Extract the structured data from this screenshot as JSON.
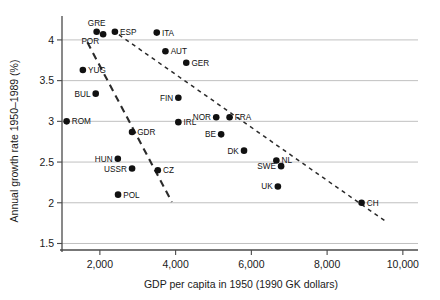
{
  "chart_data": {
    "type": "scatter",
    "title": "",
    "xlabel": "GDP per capita in 1950 (1990 GK dollars)",
    "ylabel": "Annual growth rate 1950–1989 (%)",
    "xlim": [
      1000,
      10400
    ],
    "ylim": [
      1.42,
      4.22
    ],
    "xticks": [
      2000,
      4000,
      6000,
      8000,
      10000
    ],
    "xtick_labels": [
      "2,000",
      "4,000",
      "6,000",
      "8,000",
      "10,000"
    ],
    "yticks": [
      1.5,
      2,
      2.5,
      3,
      3.5,
      4
    ],
    "ytick_labels": [
      "1.5",
      "2",
      "2.5",
      "3",
      "3.5",
      "4"
    ],
    "grid": "horizontal",
    "legend": "none",
    "marker": "filled-circle",
    "points": [
      {
        "label": "GRE",
        "x": 1915,
        "y": 4.1,
        "label_pos": "above"
      },
      {
        "label": "POR",
        "x": 2086,
        "y": 4.07,
        "label_pos": "below-left"
      },
      {
        "label": "ESP",
        "x": 2397,
        "y": 4.1,
        "label_pos": "right"
      },
      {
        "label": "ITA",
        "x": 3502,
        "y": 4.09,
        "label_pos": "right"
      },
      {
        "label": "AUT",
        "x": 3731,
        "y": 3.86,
        "label_pos": "right"
      },
      {
        "label": "GER",
        "x": 4281,
        "y": 3.72,
        "label_pos": "right"
      },
      {
        "label": "YUG",
        "x": 1551,
        "y": 3.63,
        "label_pos": "right"
      },
      {
        "label": "BUL",
        "x": 1890,
        "y": 3.34,
        "label_pos": "left"
      },
      {
        "label": "FIN",
        "x": 4072,
        "y": 3.29,
        "label_pos": "left"
      },
      {
        "label": "ROM",
        "x": 1122,
        "y": 3.0,
        "label_pos": "right"
      },
      {
        "label": "NOR",
        "x": 5072,
        "y": 3.05,
        "label_pos": "left"
      },
      {
        "label": "FRA",
        "x": 5425,
        "y": 3.05,
        "label_pos": "right"
      },
      {
        "label": "IRL",
        "x": 4072,
        "y": 2.99,
        "label_pos": "right"
      },
      {
        "label": "BE",
        "x": 5202,
        "y": 2.84,
        "label_pos": "left"
      },
      {
        "label": "GDR",
        "x": 2850,
        "y": 2.87,
        "label_pos": "right"
      },
      {
        "label": "DK",
        "x": 5806,
        "y": 2.64,
        "label_pos": "left"
      },
      {
        "label": "NL",
        "x": 6660,
        "y": 2.52,
        "label_pos": "right"
      },
      {
        "label": "SWE",
        "x": 6785,
        "y": 2.45,
        "label_pos": "left"
      },
      {
        "label": "HUN",
        "x": 2474,
        "y": 2.54,
        "label_pos": "left"
      },
      {
        "label": "USSR",
        "x": 2850,
        "y": 2.42,
        "label_pos": "left"
      },
      {
        "label": "CZ",
        "x": 3530,
        "y": 2.4,
        "label_pos": "right"
      },
      {
        "label": "UK",
        "x": 6700,
        "y": 2.2,
        "label_pos": "left"
      },
      {
        "label": "POL",
        "x": 2480,
        "y": 2.1,
        "label_pos": "right"
      },
      {
        "label": "CH",
        "x": 8910,
        "y": 2.0,
        "label_pos": "right"
      }
    ],
    "trend_lines": [
      {
        "name": "socialist-countries-trend",
        "x1": 1670,
        "y1": 3.97,
        "x2": 3900,
        "y2": 2.01,
        "dash": "7 5",
        "width": 2.1
      },
      {
        "name": "market-countries-trend",
        "x1": 2330,
        "y1": 4.12,
        "x2": 9520,
        "y2": 1.78,
        "dash": "4 4",
        "width": 1.5
      }
    ]
  }
}
